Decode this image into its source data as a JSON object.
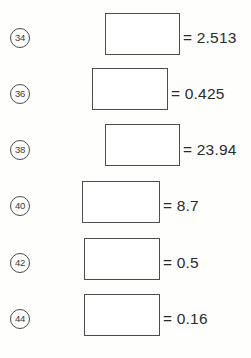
{
  "worksheet": {
    "type": "division-fill-in-the-blank",
    "background_color": "#fefefd",
    "text_color": "#2b2b2b",
    "box_border_color": "#4d4d4d",
    "answer_box_placeholder": "",
    "rows": [
      {
        "number": "34",
        "expression": "251.3 ÷",
        "answer_value": "",
        "result": "= 2.513",
        "top": 10,
        "expr_right": 105,
        "box_left": 105,
        "box_top": 13,
        "box_width": 75,
        "box_height": 42,
        "result_left": 183
      },
      {
        "number": "36",
        "expression": "425 ÷",
        "answer_value": "",
        "result": "= 0.425",
        "top": 66,
        "expr_right": 92,
        "box_left": 92,
        "box_top": 68,
        "box_width": 76,
        "box_height": 42,
        "result_left": 171
      },
      {
        "number": "38",
        "expression": "239.4 ÷",
        "answer_value": "",
        "result": "= 23.94",
        "top": 122,
        "expr_right": 105,
        "box_left": 105,
        "box_top": 124,
        "box_width": 75,
        "box_height": 42,
        "result_left": 183
      },
      {
        "number": "40",
        "expression": "87 ÷",
        "answer_value": "",
        "result": "= 8.7",
        "top": 178,
        "expr_right": 82,
        "box_left": 82,
        "box_top": 181,
        "box_width": 78,
        "box_height": 42,
        "result_left": 163
      },
      {
        "number": "42",
        "expression": "50 ÷",
        "answer_value": "",
        "result": "= 0.5",
        "top": 235,
        "expr_right": 84,
        "box_left": 84,
        "box_top": 238,
        "box_width": 76,
        "box_height": 42,
        "result_left": 163
      },
      {
        "number": "44",
        "expression": "16 ÷",
        "answer_value": "",
        "result": "= 0.16",
        "top": 291,
        "expr_right": 84,
        "box_left": 84,
        "box_top": 294,
        "box_width": 76,
        "box_height": 42,
        "result_left": 163
      }
    ]
  }
}
